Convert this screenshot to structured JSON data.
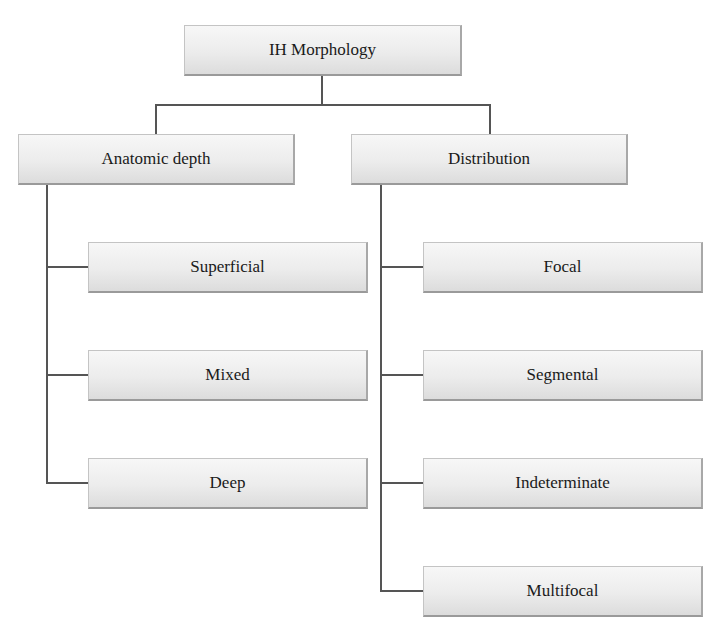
{
  "diagram": {
    "root": {
      "label": "IH Morphology"
    },
    "branches": [
      {
        "label": "Anatomic depth",
        "children": [
          {
            "label": "Superficial"
          },
          {
            "label": "Mixed"
          },
          {
            "label": "Deep"
          }
        ]
      },
      {
        "label": "Distribution",
        "children": [
          {
            "label": "Focal"
          },
          {
            "label": "Segmental"
          },
          {
            "label": "Indeterminate"
          },
          {
            "label": "Multifocal"
          }
        ]
      }
    ]
  }
}
